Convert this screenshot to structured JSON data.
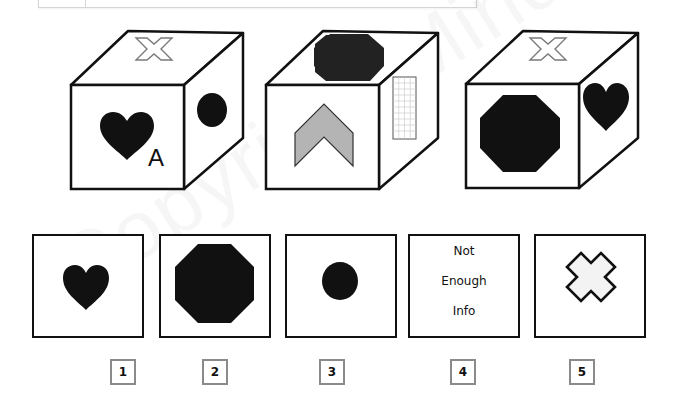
{
  "puzzle": {
    "type": "cube-rotation",
    "cubes": [
      {
        "id": 1,
        "top": "cross-outline",
        "front": "heart",
        "front_letter": "A",
        "right": "circle"
      },
      {
        "id": 2,
        "top": "octagon",
        "front": "chevron-up-gray",
        "right": "grid-rectangle"
      },
      {
        "id": 3,
        "top": "cross-outline",
        "front": "octagon",
        "right": "heart"
      }
    ],
    "answers": [
      {
        "label": "1",
        "content": "heart"
      },
      {
        "label": "2",
        "content": "octagon"
      },
      {
        "label": "3",
        "content": "circle"
      },
      {
        "label": "4",
        "content": "text",
        "lines": [
          "Not",
          "Enough",
          "Info"
        ]
      },
      {
        "label": "5",
        "content": "cross-outline"
      }
    ],
    "colors": {
      "shape_fill": "#111111",
      "chevron_fill": "#b4b4b4",
      "cross_stroke": "#7a7a7a",
      "label_border": "#8a8a8a"
    }
  },
  "watermark": "Copyright Mindmetrique"
}
